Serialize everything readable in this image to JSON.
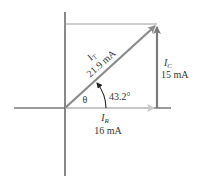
{
  "diagram": {
    "type": "phasor-diagram",
    "colors": {
      "axis": "#3a3a3a",
      "total_current": "#8a8a8a",
      "resistive_current": "#c8c8c8",
      "capacitive_current": "#7a7a7a",
      "guide_line": "#9a9a9a",
      "text": "#333333"
    },
    "vectors": {
      "total": {
        "symbol": "I",
        "subscript": "T",
        "value": "21.9 mA"
      },
      "capacitive": {
        "symbol": "I",
        "subscript": "C",
        "value": "15 mA"
      },
      "resistive": {
        "symbol": "I",
        "subscript": "R",
        "value": "16 mA"
      }
    },
    "angle": {
      "symbol": "θ",
      "value": "43.2°"
    }
  }
}
